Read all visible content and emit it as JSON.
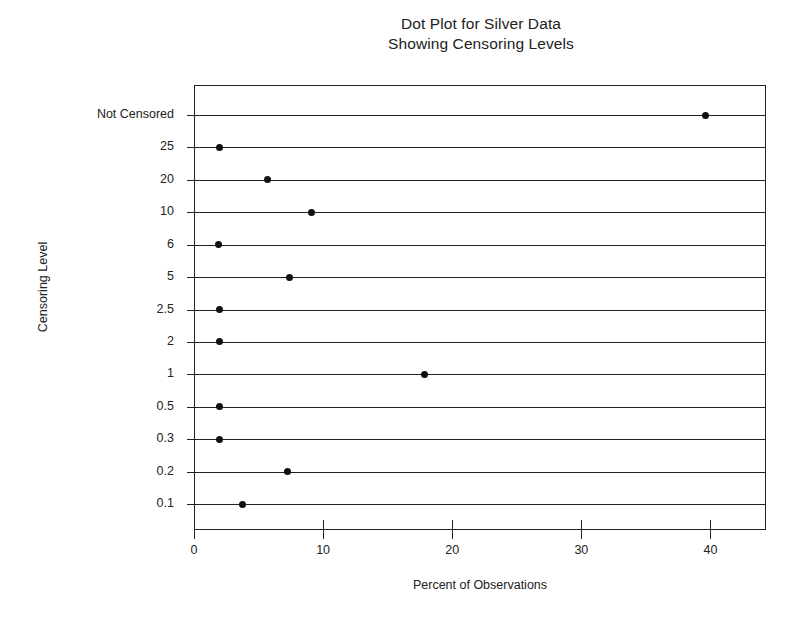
{
  "chart_data": {
    "type": "scatter",
    "title": "Dot Plot for Silver Data Showing Censoring Levels",
    "title_lines": [
      "Dot Plot for Silver Data",
      "Showing Censoring Levels"
    ],
    "xlabel": "Percent of Observations",
    "ylabel": "Censoring Level",
    "xlim": [
      0,
      44.3
    ],
    "xticks": [
      0,
      10,
      20,
      30,
      40
    ],
    "xtick_labels": [
      "0",
      "10",
      "20",
      "30",
      "40"
    ],
    "grid": false,
    "legend": null,
    "orientation": "horizontal-lollipop",
    "note": "Each censoring level row is drawn as a horizontal rule spanning the full plot width with a single filled dot marking the percent of observations.",
    "categories": [
      "Not Censored",
      "25",
      "20",
      "10",
      "6",
      "5",
      "2.5",
      "2",
      "1",
      "0.5",
      "0.3",
      "0.2",
      "0.1"
    ],
    "values": [
      39.5,
      1.9,
      5.6,
      9.0,
      1.8,
      7.3,
      1.9,
      1.9,
      17.8,
      1.9,
      1.9,
      7.2,
      3.7
    ],
    "points": [
      {
        "category": "Not Censored",
        "value": 39.5
      },
      {
        "category": "25",
        "value": 1.9
      },
      {
        "category": "20",
        "value": 5.6
      },
      {
        "category": "10",
        "value": 9.0
      },
      {
        "category": "6",
        "value": 1.8
      },
      {
        "category": "5",
        "value": 7.3
      },
      {
        "category": "2.5",
        "value": 1.9
      },
      {
        "category": "2",
        "value": 1.9
      },
      {
        "category": "1",
        "value": 17.8
      },
      {
        "category": "0.5",
        "value": 1.9
      },
      {
        "category": "0.3",
        "value": 1.9
      },
      {
        "category": "0.2",
        "value": 7.2
      },
      {
        "category": "0.1",
        "value": 3.7
      }
    ],
    "colors": {
      "marker": "#111111",
      "line": "#222222",
      "axis": "#222222",
      "background": "#ffffff"
    }
  }
}
